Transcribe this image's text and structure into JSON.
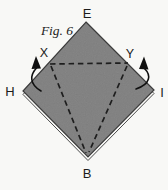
{
  "figure": {
    "label": "Fig. 6",
    "labels": {
      "top": "E",
      "left": "H",
      "right": "I",
      "bottom": "B",
      "fold_left": "X",
      "fold_right": "Y"
    },
    "colors": {
      "background": "#f8f8f6",
      "paper_fill": "#8b8b8b",
      "paper_edge": "#3e3e3e",
      "under_layer_fill": "#fbfbf9",
      "fold_line": "#1e1e1e",
      "arrow": "#101010",
      "label_text": "#1c1c1c"
    }
  }
}
